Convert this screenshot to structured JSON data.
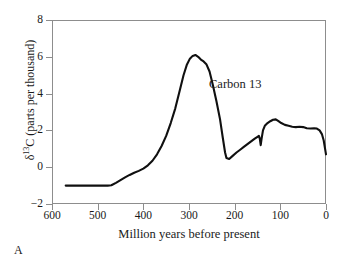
{
  "panel": {
    "label": "A"
  },
  "annotation": {
    "text": "Carbon 13"
  },
  "axes": {
    "x": {
      "title": "Million years before present",
      "ticks": [
        "600",
        "500",
        "400",
        "300",
        "200",
        "100",
        "0"
      ],
      "min": 0,
      "max": 600,
      "reversed": true
    },
    "y": {
      "title_prefix": "δ",
      "title_sup": "13",
      "title_suffix": "C (parts per thousand)",
      "ticks": [
        "8",
        "6",
        "4",
        "2",
        "0",
        "−2"
      ],
      "min": -2,
      "max": 8
    }
  },
  "colors": {
    "background": "#ffffff",
    "frame": "#8d8d8d",
    "curve": "#101010",
    "text": "#1a1a1a"
  },
  "chart_data": {
    "type": "line",
    "title": "",
    "xlabel": "Million years before present",
    "ylabel": "δ13C (parts per thousand)",
    "xlim": [
      600,
      0
    ],
    "ylim": [
      -2,
      8
    ],
    "x_reversed": true,
    "grid": false,
    "legend": "none",
    "annotations": [
      {
        "text": "Carbon 13",
        "x": 265,
        "y": 4.3
      },
      {
        "text": "A",
        "x": null,
        "y": null
      }
    ],
    "series": [
      {
        "name": "Carbon 13",
        "x": [
          570,
          550,
          530,
          510,
          490,
          478,
          470,
          460,
          450,
          440,
          430,
          420,
          410,
          400,
          390,
          380,
          370,
          360,
          350,
          340,
          330,
          320,
          312,
          305,
          298,
          292,
          286,
          280,
          274,
          268,
          262,
          255,
          248,
          240,
          232,
          226,
          221,
          218,
          212,
          205,
          196,
          188,
          180,
          172,
          164,
          156,
          150,
          147,
          145,
          143,
          141,
          138,
          134,
          128,
          122,
          116,
          110,
          104,
          98,
          90,
          82,
          74,
          66,
          58,
          50,
          42,
          34,
          26,
          20,
          14,
          9,
          5,
          2,
          0
        ],
        "y": [
          -1.0,
          -1.0,
          -1.0,
          -1.0,
          -1.0,
          -1.0,
          -0.98,
          -0.85,
          -0.7,
          -0.55,
          -0.42,
          -0.3,
          -0.2,
          -0.08,
          0.1,
          0.35,
          0.7,
          1.15,
          1.7,
          2.4,
          3.2,
          4.2,
          5.0,
          5.55,
          5.9,
          6.05,
          6.1,
          6.0,
          5.85,
          5.75,
          5.6,
          5.2,
          4.5,
          3.6,
          2.6,
          1.6,
          0.8,
          0.5,
          0.45,
          0.6,
          0.8,
          0.95,
          1.1,
          1.25,
          1.4,
          1.55,
          1.65,
          1.7,
          1.55,
          1.2,
          1.55,
          2.0,
          2.25,
          2.4,
          2.5,
          2.58,
          2.6,
          2.5,
          2.4,
          2.3,
          2.25,
          2.2,
          2.18,
          2.2,
          2.18,
          2.12,
          2.1,
          2.12,
          2.1,
          2.0,
          1.8,
          1.45,
          1.0,
          0.7
        ]
      }
    ]
  }
}
